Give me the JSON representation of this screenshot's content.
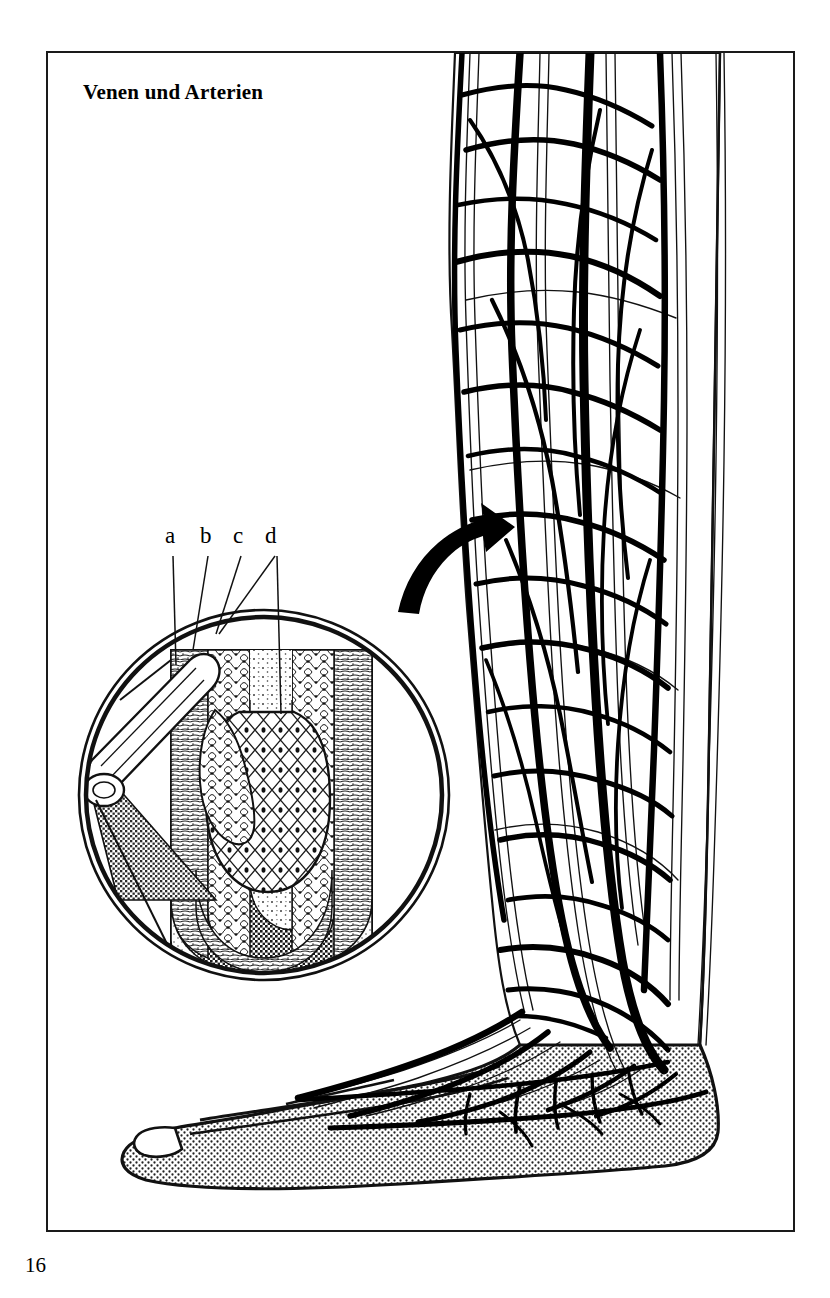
{
  "figure": {
    "title": "Venen und Arterien",
    "page_number": "16",
    "language": "de"
  },
  "callouts": {
    "items": [
      {
        "key": "a",
        "label": "a"
      },
      {
        "key": "b",
        "label": "b"
      },
      {
        "key": "c",
        "label": "c"
      },
      {
        "key": "d",
        "label": "d"
      }
    ]
  },
  "illustration": {
    "leg": {
      "name": "lower-leg-and-foot-vasculature",
      "vein_color": "#000000",
      "artery_color": "#000000",
      "skin_fill": "#ffffff",
      "foot_fill_pattern": "stipple"
    },
    "inset": {
      "name": "vein-valve-cross-section",
      "shape": "circle",
      "center_x": 264,
      "center_y": 795,
      "radius": 186,
      "border_style": "double-ring",
      "lumen_fill_pattern": "fine-stipple",
      "wall_fill_pattern": "cell-mesh",
      "vessel_fill_pattern": "dark-crosshatch"
    },
    "arrow": {
      "name": "inset-pointer-arrow",
      "color": "#000000",
      "direction": "up-right"
    }
  }
}
